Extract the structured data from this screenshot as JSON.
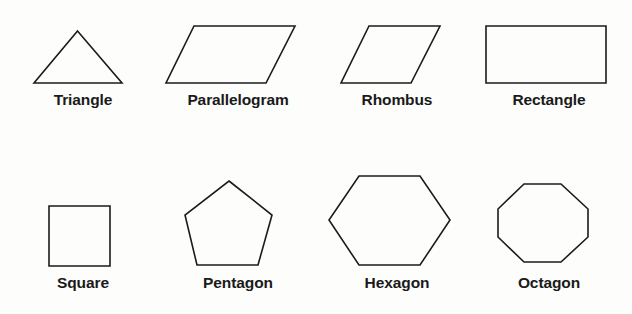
{
  "figure": {
    "title_visible": false,
    "background_color": "#fdfdfc",
    "stroke_color": "#1b1b1b",
    "label_color": "#1a1a1a",
    "rows": 2,
    "columns": 4
  },
  "shapes": [
    {
      "name": "triangle",
      "label": "Triangle",
      "sides": 3,
      "row": 1,
      "column": 1,
      "polygon_points": "44,52 45,0 0,52",
      "bbox": {
        "x": 33,
        "y": 30,
        "width": 89,
        "height": 52
      },
      "points_px": [
        [
          77,
          30
        ],
        [
          122,
          82
        ],
        [
          33,
          82
        ]
      ]
    },
    {
      "name": "parallelogram",
      "label": "Parallelogram",
      "sides": 4,
      "row": 1,
      "column": 2,
      "bbox": {
        "x": 165,
        "y": 25,
        "width": 130,
        "height": 57
      },
      "points_px": [
        [
          194,
          25
        ],
        [
          295,
          25
        ],
        [
          266,
          82
        ],
        [
          165,
          82
        ]
      ]
    },
    {
      "name": "rhombus",
      "label": "Rhombus",
      "sides": 4,
      "row": 1,
      "column": 3,
      "bbox": {
        "x": 340,
        "y": 25,
        "width": 100,
        "height": 57
      },
      "points_px": [
        [
          369,
          25
        ],
        [
          440,
          25
        ],
        [
          411,
          82
        ],
        [
          340,
          82
        ]
      ]
    },
    {
      "name": "rectangle",
      "label": "Rectangle",
      "sides": 4,
      "row": 1,
      "column": 4,
      "bbox": {
        "x": 485,
        "y": 25,
        "width": 121,
        "height": 57
      },
      "points_px": [
        [
          485,
          25
        ],
        [
          606,
          25
        ],
        [
          606,
          82
        ],
        [
          485,
          82
        ]
      ]
    },
    {
      "name": "square",
      "label": "Square",
      "sides": 4,
      "row": 2,
      "column": 1,
      "bbox": {
        "x": 48,
        "y": 205,
        "width": 62,
        "height": 61
      },
      "points_px": [
        [
          48,
          205
        ],
        [
          110,
          205
        ],
        [
          110,
          266
        ],
        [
          48,
          266
        ]
      ]
    },
    {
      "name": "pentagon",
      "label": "Pentagon",
      "sides": 5,
      "row": 2,
      "column": 2,
      "bbox": {
        "x": 184,
        "y": 180,
        "width": 88,
        "height": 85
      },
      "points_px": [
        [
          229,
          180
        ],
        [
          272,
          214
        ],
        [
          258,
          265
        ],
        [
          197,
          265
        ],
        [
          184,
          214
        ]
      ]
    },
    {
      "name": "hexagon",
      "label": "Hexagon",
      "sides": 6,
      "row": 2,
      "column": 3,
      "bbox": {
        "x": 328,
        "y": 175,
        "width": 122,
        "height": 90
      },
      "points_px": [
        [
          359,
          175
        ],
        [
          420,
          175
        ],
        [
          450,
          220
        ],
        [
          420,
          265
        ],
        [
          359,
          265
        ],
        [
          328,
          220
        ]
      ]
    },
    {
      "name": "octagon",
      "label": "Octagon",
      "sides": 8,
      "row": 2,
      "column": 4,
      "bbox": {
        "x": 497,
        "y": 183,
        "width": 92,
        "height": 79
      },
      "points_px": [
        [
          524,
          183
        ],
        [
          561,
          183
        ],
        [
          589,
          208
        ],
        [
          589,
          236
        ],
        [
          561,
          262
        ],
        [
          524,
          262
        ],
        [
          497,
          236
        ],
        [
          497,
          208
        ]
      ]
    }
  ]
}
